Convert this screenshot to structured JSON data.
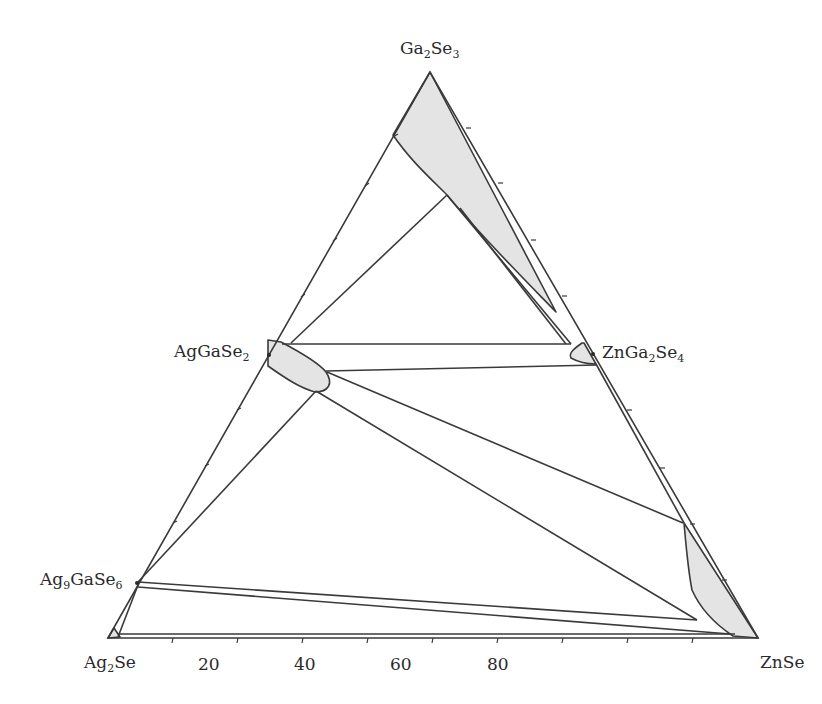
{
  "diagram": {
    "type": "ternary phase diagram (isothermal section)",
    "vertices": {
      "top": {
        "formula": "Ga2Se3",
        "base": "Ga",
        "sub1": "2",
        "mid": "Se",
        "sub2": "3"
      },
      "bottom_left": {
        "formula": "Ag2Se",
        "base": "Ag",
        "sub1": "2",
        "mid": "Se"
      },
      "bottom_right": {
        "formula": "ZnSe",
        "text": "ZnSe"
      }
    },
    "compounds": [
      {
        "formula": "AgGaSe2",
        "base": "AgGaSe",
        "sub": "2"
      },
      {
        "formula": "ZnGa2Se4",
        "base": "ZnGa",
        "sub1": "2",
        "mid": "Se",
        "sub2": "4"
      },
      {
        "formula": "Ag9GaSe6",
        "base": "Ag",
        "sub1": "9",
        "mid": "GaSe",
        "sub2": "6"
      }
    ],
    "bottom_axis_ticks": [
      "20",
      "40",
      "60",
      "80"
    ],
    "colors": {
      "line": "#3a3a3a",
      "fill": "#e6e6e6",
      "background": "#ffffff"
    }
  }
}
